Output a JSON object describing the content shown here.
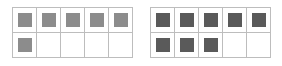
{
  "frames": [
    {
      "name": "ten-frame-left",
      "filled": 6,
      "total": 10,
      "counter_color": "#8c8c8c"
    },
    {
      "name": "ten-frame-right",
      "filled": 8,
      "total": 10,
      "counter_color": "#5a5a5a"
    }
  ],
  "grid_color": "#bdbdbd"
}
